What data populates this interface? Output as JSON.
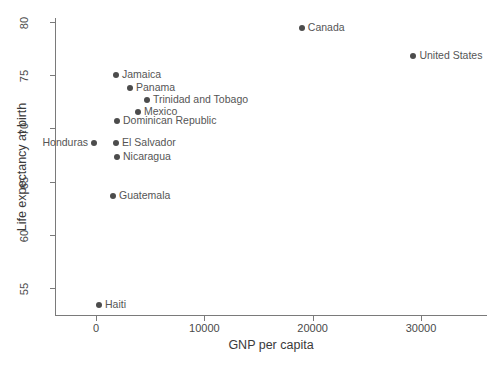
{
  "chart_data": {
    "type": "scatter",
    "title": "",
    "xlabel": "GNP per capita",
    "ylabel": "Life expectancy at birth",
    "xlim": [
      -4000,
      36000
    ],
    "ylim": [
      52.5,
      81.0
    ],
    "xticks": [
      0,
      10000,
      20000,
      30000
    ],
    "xticklabels": [
      "0",
      "10000",
      "20000",
      "30000"
    ],
    "yticks": [
      55,
      60,
      65,
      70,
      75,
      80
    ],
    "yticklabels": [
      "55",
      "60",
      "65",
      "70",
      "75",
      "80"
    ],
    "grid": false,
    "legend": "none",
    "points": [
      {
        "label": "Canada",
        "x": 19000,
        "y": 79.4,
        "label_side": "right"
      },
      {
        "label": "United States",
        "x": 29300,
        "y": 76.8,
        "label_side": "right"
      },
      {
        "label": "Jamaica",
        "x": 1850,
        "y": 75.0,
        "label_side": "right"
      },
      {
        "label": "Panama",
        "x": 3140,
        "y": 73.8,
        "label_side": "right"
      },
      {
        "label": "Trinidad and Tobago",
        "x": 4700,
        "y": 72.7,
        "label_side": "right"
      },
      {
        "label": "Mexico",
        "x": 3880,
        "y": 71.5,
        "label_side": "right"
      },
      {
        "label": "Dominican Republic",
        "x": 1940,
        "y": 70.7,
        "label_side": "right"
      },
      {
        "label": "Honduras",
        "x": -180,
        "y": 68.6,
        "label_side": "left"
      },
      {
        "label": "El Salvador",
        "x": 1850,
        "y": 68.6,
        "label_side": "right"
      },
      {
        "label": "Nicaragua",
        "x": 1940,
        "y": 67.3,
        "label_side": "right"
      },
      {
        "label": "Guatemala",
        "x": 1570,
        "y": 63.6,
        "label_side": "right"
      },
      {
        "label": "Haiti",
        "x": 280,
        "y": 53.4,
        "label_side": "right"
      }
    ]
  },
  "style": {
    "marker_color": "#4c4c4c",
    "axis_color": "#7a7a7a",
    "label_color": "#555555",
    "background": "#ffffff"
  }
}
